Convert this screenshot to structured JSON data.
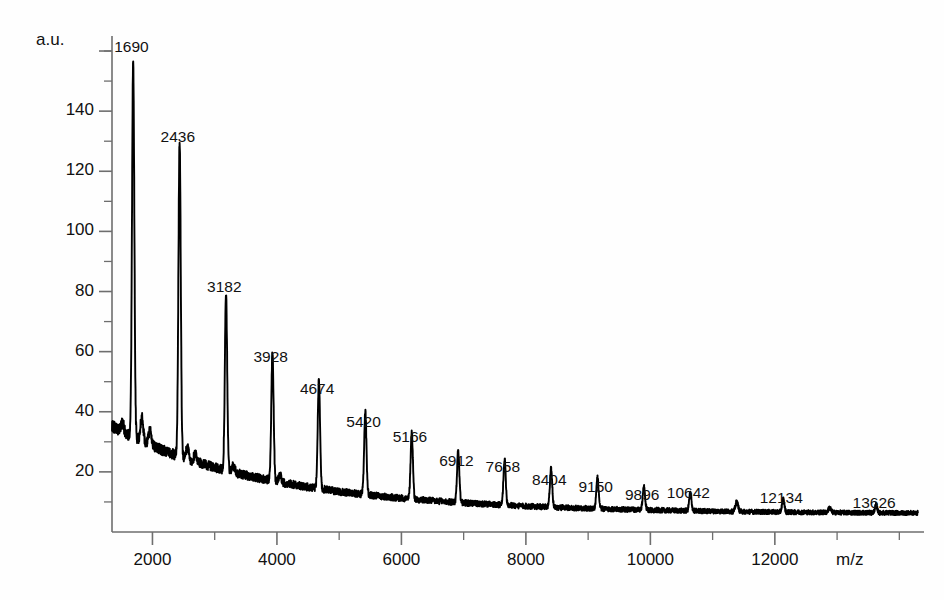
{
  "chart_data": {
    "type": "line",
    "title": "",
    "xlabel": "m/z",
    "ylabel": "a.u.",
    "xlim": [
      1350,
      14300
    ],
    "ylim": [
      0,
      163
    ],
    "grid": false,
    "legend": null,
    "x_ticks": [
      2000,
      4000,
      6000,
      8000,
      10000,
      12000
    ],
    "x_tick_labels": [
      "2000",
      "4000",
      "6000",
      "8000",
      "10000",
      "12000"
    ],
    "x_minor_step": 1000,
    "y_ticks": [
      20,
      40,
      60,
      80,
      100,
      120,
      140
    ],
    "y_tick_labels": [
      "20",
      "40",
      "60",
      "80",
      "100",
      "120",
      "140"
    ],
    "y_minor_step": 10,
    "series_name": "MALDI-TOF mass spectrum",
    "trace_color": "#000000",
    "axis_color": "#6e6e6e",
    "leader_color": "#8a8a8a",
    "baseline_start": 33,
    "baseline_end": 6,
    "peak_spacing": 746,
    "annotations": [
      {
        "label": "1690",
        "mz": 1690,
        "height": 157,
        "label_dx": -2,
        "label_dy": -20
      },
      {
        "label": "2436",
        "mz": 2436,
        "height": 130,
        "label_dx": -2,
        "label_dy": -20
      },
      {
        "label": "3182",
        "mz": 3182,
        "height": 79,
        "label_dx": -2,
        "label_dy": -20
      },
      {
        "label": "3928",
        "mz": 3928,
        "height": 60,
        "label_dx": -2,
        "label_dy": -20
      },
      {
        "label": "4674",
        "mz": 4674,
        "height": 50,
        "label_dx": -2,
        "label_dy": -20
      },
      {
        "label": "5420",
        "mz": 5420,
        "height": 40,
        "label_dx": -2,
        "label_dy": -20
      },
      {
        "label": "5166",
        "mz": 6166,
        "height": 33,
        "label_dx": -2,
        "label_dy": -20
      },
      {
        "label": "6912",
        "mz": 6912,
        "height": 27,
        "label_dx": -2,
        "label_dy": -20
      },
      {
        "label": "7658",
        "mz": 7658,
        "height": 24,
        "label_dx": -2,
        "label_dy": -20
      },
      {
        "label": "8404",
        "mz": 8404,
        "height": 21,
        "label_dx": -2,
        "label_dy": -20
      },
      {
        "label": "9150",
        "mz": 9150,
        "height": 18,
        "label_dx": -2,
        "label_dy": -20
      },
      {
        "label": "9896",
        "mz": 9896,
        "height": 15,
        "label_dx": -2,
        "label_dy": -20
      },
      {
        "label": "10642",
        "mz": 10642,
        "height": 13,
        "label_dx": -2,
        "label_dy": -20
      },
      {
        "label": "12134",
        "mz": 12134,
        "height": 11,
        "label_dx": -2,
        "label_dy": -20
      },
      {
        "label": "13626",
        "mz": 13626,
        "height": 9,
        "label_dx": -2,
        "label_dy": -20
      }
    ],
    "minor_peaks": [
      {
        "mz": 1520,
        "height": 36
      },
      {
        "mz": 1830,
        "height": 38
      },
      {
        "mz": 1960,
        "height": 34
      },
      {
        "mz": 2560,
        "height": 28
      },
      {
        "mz": 2690,
        "height": 26
      },
      {
        "mz": 3300,
        "height": 22
      },
      {
        "mz": 4050,
        "height": 19
      },
      {
        "mz": 11388,
        "height": 10
      },
      {
        "mz": 12880,
        "height": 8
      }
    ]
  }
}
